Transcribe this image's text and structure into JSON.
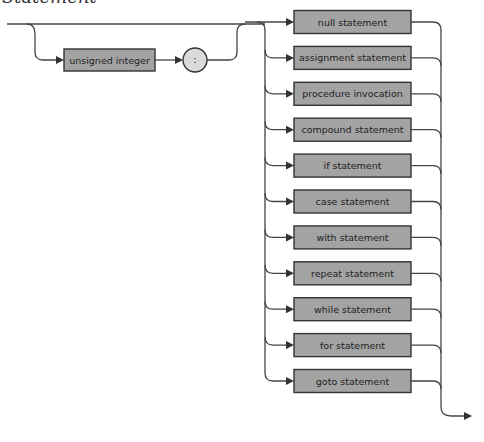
{
  "diagram": {
    "title": "Statement",
    "type": "syntax-diagram",
    "prefix": {
      "optional": true,
      "nodes": [
        {
          "kind": "nonterminal",
          "label": "unsigned integer"
        },
        {
          "kind": "terminal",
          "label": ":"
        }
      ]
    },
    "alternatives": [
      "null statement",
      "assignment statement",
      "procedure invocation",
      "compound statement",
      "if statement",
      "case statement",
      "with statement",
      "repeat statement",
      "while statement",
      "for statement",
      "goto statement"
    ],
    "colors": {
      "box_fill": "#a3a3a3",
      "terminal_fill": "#dadada",
      "line": "#444444"
    }
  }
}
